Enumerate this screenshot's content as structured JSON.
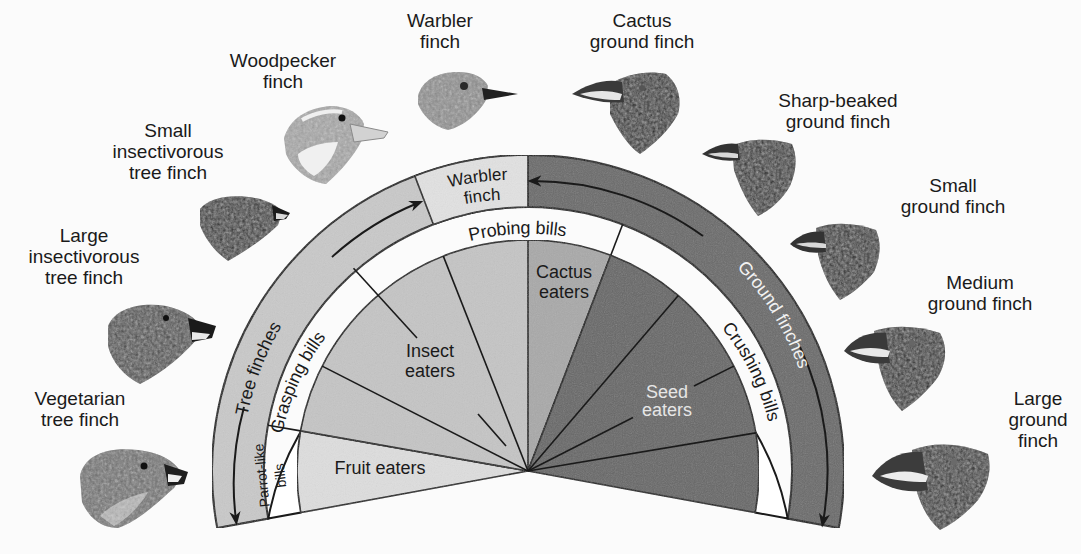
{
  "diagram": {
    "center": [
      528,
      471
    ],
    "radii": {
      "outer": 316,
      "band": 264,
      "inner": 231
    },
    "colors": {
      "background": "#fbfbfb",
      "tree_band": "#c9c9c9",
      "ground_band": "#6b6b6b",
      "warbler_box": "#e2e2e2",
      "bill_band": "#ffffff",
      "fruit": "#dedede",
      "insect": "#c5c5c5",
      "cactus": "#a9a9a9",
      "seed": "#676767",
      "line": "#1a1a1a"
    },
    "outer_band": {
      "tree_finches": "Tree finches",
      "ground_finches": "Ground finches",
      "warbler_box": "Warbler\nfinch",
      "warbler_line1": "Warbler",
      "warbler_line2": "finch"
    },
    "bill_types": {
      "parrot_like_line1": "Parrot-like",
      "parrot_like_line2": "bills",
      "grasping": "Grasping bills",
      "probing": "Probing bills",
      "crushing": "Crushing bills"
    },
    "diets": {
      "fruit": "Fruit eaters",
      "insect_line1": "Insect",
      "insect_line2": "eaters",
      "cactus_line1": "Cactus",
      "cactus_line2": "eaters",
      "seed_line1": "Seed",
      "seed_line2": "eaters"
    },
    "species": [
      {
        "id": "vegetarian-tree-finch",
        "label": "Vegetarian\ntree finch"
      },
      {
        "id": "large-insectivorous-tree-finch",
        "label": "Large\ninsectivorous\ntree finch"
      },
      {
        "id": "small-insectivorous-tree-finch",
        "label": "Small\ninsectivorous\ntree finch"
      },
      {
        "id": "woodpecker-finch",
        "label": "Woodpecker\nfinch"
      },
      {
        "id": "warbler-finch",
        "label": "Warbler\nfinch"
      },
      {
        "id": "cactus-ground-finch",
        "label": "Cactus\nground finch"
      },
      {
        "id": "sharp-beaked-ground-finch",
        "label": "Sharp-beaked\nground finch"
      },
      {
        "id": "small-ground-finch",
        "label": "Small\nground finch"
      },
      {
        "id": "medium-ground-finch",
        "label": "Medium\nground finch"
      },
      {
        "id": "large-ground-finch",
        "label": "Large\nground\nfinch"
      }
    ]
  }
}
